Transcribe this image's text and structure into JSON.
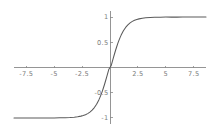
{
  "chart_data": {
    "type": "line",
    "title": "",
    "subtitle": "",
    "xlabel": "",
    "ylabel": "",
    "xlim": [
      -8.6,
      8.6
    ],
    "ylim": [
      -1.12,
      1.12
    ],
    "grid": false,
    "legend": false,
    "legend_position": "none",
    "axes_style": "through-origin",
    "line_color": "#5a5a5a",
    "axis_color": "#8a8a8a",
    "label_color": "#7d7d7d",
    "background_color": "#ffffff",
    "xticks": [
      -7.5,
      -5,
      -2.5,
      2.5,
      5,
      7.5
    ],
    "xtick_labels": [
      "-7.5",
      "-5",
      "-2.5",
      "2.5",
      "5",
      "7.5"
    ],
    "yticks": [
      1,
      0.5,
      -0.5,
      -1
    ],
    "ytick_labels": [
      "1",
      "0.5",
      "-0.5",
      "-1"
    ],
    "series": [
      {
        "name": "tanh",
        "x": [
          -8.6,
          -8.0,
          -7.5,
          -7.0,
          -6.5,
          -6.0,
          -5.5,
          -5.0,
          -4.5,
          -4.0,
          -3.6,
          -3.2,
          -2.9,
          -2.6,
          -2.4,
          -2.2,
          -2.0,
          -1.8,
          -1.6,
          -1.4,
          -1.2,
          -1.0,
          -0.9,
          -0.8,
          -0.7,
          -0.6,
          -0.5,
          -0.4,
          -0.3,
          -0.2,
          -0.1,
          0.0,
          0.1,
          0.2,
          0.3,
          0.4,
          0.5,
          0.6,
          0.7,
          0.8,
          0.9,
          1.0,
          1.2,
          1.4,
          1.6,
          1.8,
          2.0,
          2.2,
          2.4,
          2.6,
          2.9,
          3.2,
          3.6,
          4.0,
          4.5,
          5.0,
          5.5,
          6.0,
          6.5,
          7.0,
          7.5,
          8.0,
          8.6
        ],
        "y": [
          -1.0,
          -1.0,
          -1.0,
          -1.0,
          -1.0,
          -0.999,
          -0.999,
          -0.999,
          -0.998,
          -0.996,
          -0.992,
          -0.985,
          -0.977,
          -0.964,
          -0.952,
          -0.936,
          -0.914,
          -0.885,
          -0.846,
          -0.794,
          -0.727,
          -0.642,
          -0.592,
          -0.537,
          -0.477,
          -0.412,
          -0.342,
          -0.268,
          -0.191,
          -0.113,
          -0.034,
          0.0,
          0.034,
          0.113,
          0.191,
          0.268,
          0.342,
          0.412,
          0.477,
          0.537,
          0.592,
          0.642,
          0.727,
          0.794,
          0.846,
          0.885,
          0.914,
          0.936,
          0.952,
          0.964,
          0.977,
          0.985,
          0.992,
          0.996,
          0.998,
          0.999,
          0.999,
          0.999,
          1.0,
          1.0,
          1.0,
          1.0,
          1.0
        ]
      }
    ]
  }
}
